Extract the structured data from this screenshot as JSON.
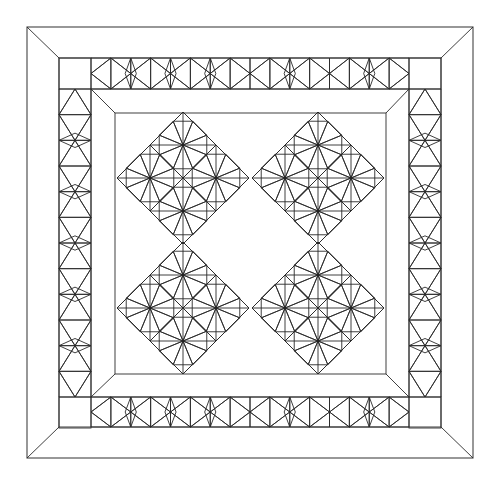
{
  "canvas": {
    "width": 498,
    "height": 484,
    "background": "#ffffff"
  },
  "colors": {
    "line": "#2a2a2a",
    "dark": "#3a3a3a",
    "gray_border": "#a9a9a9",
    "light_fill": "#eeeeee",
    "white": "#ffffff"
  },
  "quilt": {
    "outer_frame": {
      "x1": 27,
      "y1": 27,
      "x2": 473,
      "y2": 458
    },
    "pieced_border": {
      "x1": 59,
      "y1": 58,
      "x2": 441,
      "y2": 427
    },
    "gray_border": {
      "x1": 91,
      "y1": 89,
      "x2": 409,
      "y2": 397
    },
    "center_field": {
      "x1": 115,
      "y1": 113,
      "x2": 386,
      "y2": 374
    },
    "border_units": {
      "top": [
        "light-dots",
        "check",
        "dark",
        "dots",
        "plain",
        "dark",
        "plain",
        "plain",
        "check",
        "dark",
        "dots",
        "plain",
        "check",
        "dark",
        "check",
        "plain"
      ],
      "bottom": [
        "plain",
        "check",
        "dark",
        "plain",
        "plain",
        "dark",
        "check",
        "plain",
        "plain",
        "dark",
        "plain",
        "dots",
        "plain",
        "dark",
        "plain",
        "plain"
      ],
      "left": [
        "light",
        "dark",
        "check",
        "dark",
        "dots",
        "dark",
        "plain",
        "dark",
        "check",
        "plain",
        "light",
        "plain"
      ],
      "right": [
        "plain",
        "light",
        "dark",
        "check",
        "dark",
        "plain",
        "dots",
        "dark",
        "light",
        "dark",
        "plain",
        "light"
      ]
    },
    "blocks": [
      {
        "name": "block-top-left",
        "cx": 183,
        "cy": 178,
        "h": 66,
        "fills": {
          "n": [
            "plain",
            "light",
            "dots",
            "hatch"
          ],
          "w": [
            "dark",
            "dots",
            "stripes",
            "light"
          ],
          "e": [
            "check",
            "light",
            "stripes",
            "plain"
          ],
          "s": [
            "dark",
            "dots",
            "plain",
            "plain"
          ]
        }
      },
      {
        "name": "block-top-right",
        "cx": 318,
        "cy": 178,
        "h": 66,
        "fills": {
          "n": [
            "plain",
            "light",
            "dots",
            "light"
          ],
          "w": [
            "dark",
            "light",
            "plain",
            "dots"
          ],
          "e": [
            "hatch",
            "light",
            "plain",
            "dots"
          ],
          "s": [
            "dark",
            "check",
            "plain",
            "light"
          ]
        }
      },
      {
        "name": "block-bottom-left",
        "cx": 183,
        "cy": 308,
        "h": 66,
        "fills": {
          "n": [
            "plain",
            "light",
            "dots",
            "light"
          ],
          "w": [
            "hatch",
            "light",
            "plain",
            "dots"
          ],
          "e": [
            "dark",
            "light",
            "plain",
            "dots"
          ],
          "s": [
            "dark",
            "check",
            "plain",
            "light"
          ]
        }
      },
      {
        "name": "block-bottom-right",
        "cx": 318,
        "cy": 308,
        "h": 66,
        "fills": {
          "n": [
            "plain",
            "light",
            "dots",
            "dots"
          ],
          "w": [
            "dark",
            "hatch",
            "stripes",
            "light"
          ],
          "e": [
            "check",
            "plain",
            "stripes",
            "plain"
          ],
          "s": [
            "dark",
            "dots",
            "plain",
            "plain"
          ]
        }
      }
    ]
  }
}
